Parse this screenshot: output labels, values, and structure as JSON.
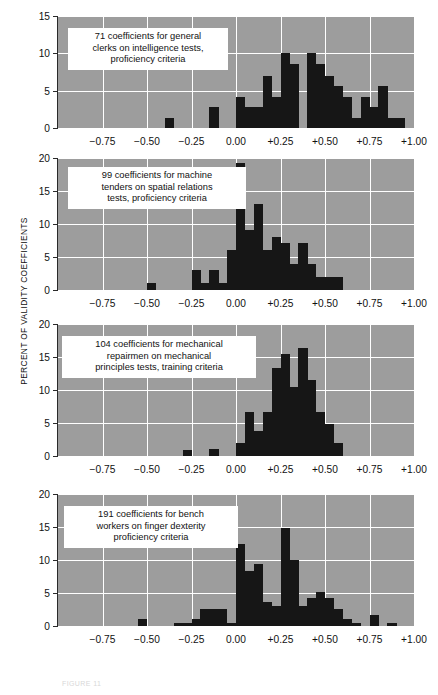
{
  "figure": {
    "y_axis_title": "PERCENT OF VALIDITY COEFFICIENTS",
    "caption": "FIGURE 11",
    "plot_bg_color": "#9d9d9d",
    "bar_color": "#161616",
    "grid_color": "#ffffff",
    "axis_color": "#2a2a2a"
  },
  "x_axis": {
    "ticks": [
      "-0.75",
      "-0.50",
      "-0.25",
      "0.00",
      "+0.25",
      "+0.50",
      "+0.75",
      "+1.00"
    ],
    "tick_values": [
      -0.75,
      -0.5,
      -0.25,
      0.0,
      0.25,
      0.5,
      0.75,
      1.0
    ],
    "min": -1.0,
    "max": 1.0
  },
  "chart_data": [
    {
      "type": "bar",
      "id": "panel-1",
      "title": "71 coefficients for general\nclerks on intelligence tests,\nproficiency criteria",
      "n_coefficients": 71,
      "xlabel": "",
      "ylabel": "PERCENT OF VALIDITY COEFFICIENTS",
      "ylim": [
        0,
        15
      ],
      "yticks": [
        0,
        5,
        10,
        15
      ],
      "grid": true,
      "bin_width": 0.05,
      "bin_starts": [
        -1.0,
        -0.95,
        -0.9,
        -0.85,
        -0.8,
        -0.75,
        -0.7,
        -0.65,
        -0.6,
        -0.55,
        -0.5,
        -0.45,
        -0.4,
        -0.35,
        -0.3,
        -0.25,
        -0.2,
        -0.15,
        -0.1,
        -0.05,
        0.0,
        0.05,
        0.1,
        0.15,
        0.2,
        0.25,
        0.3,
        0.35,
        0.4,
        0.45,
        0.5,
        0.55,
        0.6,
        0.65,
        0.7,
        0.75,
        0.8,
        0.85,
        0.9,
        0.95
      ],
      "values": [
        0,
        0,
        0,
        0,
        0,
        0,
        0,
        0,
        0,
        0,
        0,
        0,
        1.4,
        0,
        0,
        0,
        0,
        2.8,
        0,
        0,
        4.2,
        2.8,
        2.8,
        7.0,
        4.2,
        10.0,
        8.6,
        0,
        10.0,
        8.6,
        7.0,
        5.6,
        4.2,
        1.4,
        4.2,
        2.8,
        5.6,
        1.4,
        1.4,
        0
      ]
    },
    {
      "type": "bar",
      "id": "panel-2",
      "title": "99 coefficients for machine\ntenders on spatial relations\ntests, proficiency criteria",
      "n_coefficients": 99,
      "xlabel": "",
      "ylabel": "PERCENT OF VALIDITY COEFFICIENTS",
      "ylim": [
        0,
        20
      ],
      "yticks": [
        0,
        5,
        10,
        15,
        20
      ],
      "grid": true,
      "bin_width": 0.05,
      "bin_starts": [
        -1.0,
        -0.95,
        -0.9,
        -0.85,
        -0.8,
        -0.75,
        -0.7,
        -0.65,
        -0.6,
        -0.55,
        -0.5,
        -0.45,
        -0.4,
        -0.35,
        -0.3,
        -0.25,
        -0.2,
        -0.15,
        -0.1,
        -0.05,
        0.0,
        0.05,
        0.1,
        0.15,
        0.2,
        0.25,
        0.3,
        0.35,
        0.4,
        0.45,
        0.5,
        0.55,
        0.6,
        0.65,
        0.7,
        0.75,
        0.8,
        0.85,
        0.9,
        0.95
      ],
      "values": [
        0,
        0,
        0,
        0,
        0,
        0,
        0,
        0,
        0,
        0,
        1.0,
        0,
        0,
        0,
        0,
        3.0,
        1.0,
        3.0,
        1.0,
        6.0,
        19.2,
        9.1,
        13.1,
        6.1,
        8.1,
        7.1,
        4.0,
        7.1,
        4.0,
        2.0,
        2.0,
        2.0,
        0,
        0,
        0,
        0,
        0,
        0,
        0,
        0
      ]
    },
    {
      "type": "bar",
      "id": "panel-3",
      "title": "104 coefficients for mechanical\nrepairmen on mechanical\nprinciples tests, training criteria",
      "n_coefficients": 104,
      "xlabel": "",
      "ylabel": "PERCENT OF VALIDITY COEFFICIENTS",
      "ylim": [
        0,
        20
      ],
      "yticks": [
        0,
        5,
        10,
        15,
        20
      ],
      "grid": true,
      "bin_width": 0.05,
      "bin_starts": [
        -1.0,
        -0.95,
        -0.9,
        -0.85,
        -0.8,
        -0.75,
        -0.7,
        -0.65,
        -0.6,
        -0.55,
        -0.5,
        -0.45,
        -0.4,
        -0.35,
        -0.3,
        -0.25,
        -0.2,
        -0.15,
        -0.1,
        -0.05,
        0.0,
        0.05,
        0.1,
        0.15,
        0.2,
        0.25,
        0.3,
        0.35,
        0.4,
        0.45,
        0.5,
        0.55,
        0.6,
        0.65,
        0.7,
        0.75,
        0.8,
        0.85,
        0.9,
        0.95
      ],
      "values": [
        0,
        0,
        0,
        0,
        0,
        0,
        0,
        0,
        0,
        0,
        0,
        0,
        0,
        0,
        0.9,
        0,
        0,
        1.0,
        0,
        0,
        1.9,
        6.7,
        3.8,
        6.7,
        13.4,
        15.4,
        10.5,
        16.3,
        11.5,
        6.7,
        4.8,
        1.9,
        0,
        0,
        0,
        0,
        0,
        0,
        0,
        0
      ]
    },
    {
      "type": "bar",
      "id": "panel-4",
      "title": "191 coefficients for bench\nworkers on finger dexterity\nproficiency criteria",
      "n_coefficients": 191,
      "xlabel": "",
      "ylabel": "PERCENT OF VALIDITY COEFFICIENTS",
      "ylim": [
        0,
        20
      ],
      "yticks": [
        0,
        5,
        10,
        15,
        20
      ],
      "grid": true,
      "bin_width": 0.05,
      "bin_starts": [
        -1.0,
        -0.95,
        -0.9,
        -0.85,
        -0.8,
        -0.75,
        -0.7,
        -0.65,
        -0.6,
        -0.55,
        -0.5,
        -0.45,
        -0.4,
        -0.35,
        -0.3,
        -0.25,
        -0.2,
        -0.15,
        -0.1,
        -0.05,
        0.0,
        0.05,
        0.1,
        0.15,
        0.2,
        0.25,
        0.3,
        0.35,
        0.4,
        0.45,
        0.5,
        0.55,
        0.6,
        0.65,
        0.7,
        0.75,
        0.8,
        0.85,
        0.9,
        0.95
      ],
      "values": [
        0,
        0,
        0,
        0,
        0,
        0,
        0,
        0,
        0,
        1.0,
        0,
        0,
        0,
        0.5,
        0.5,
        1.0,
        2.6,
        2.6,
        2.6,
        0.5,
        12.4,
        8.4,
        9.4,
        3.7,
        3.1,
        14.8,
        10.0,
        3.1,
        4.2,
        5.2,
        4.2,
        2.6,
        1.0,
        0.5,
        0,
        1.6,
        0,
        0.5,
        0,
        0
      ]
    }
  ]
}
